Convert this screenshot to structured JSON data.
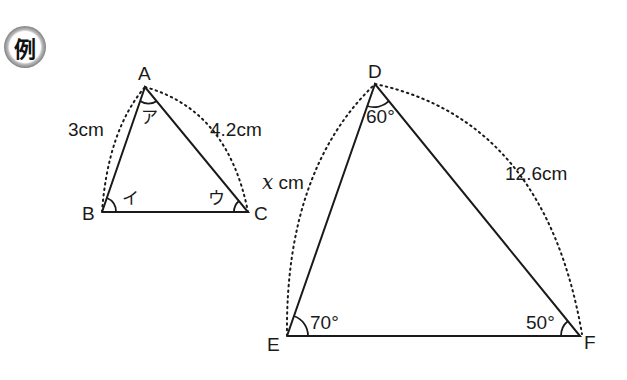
{
  "badge": {
    "label": "例"
  },
  "triangle_small": {
    "vertices": {
      "A": "A",
      "B": "B",
      "C": "C"
    },
    "angles": {
      "A": "ア",
      "B": "イ",
      "C": "ウ"
    },
    "sides": {
      "AB": "3cm",
      "AC": "4.2cm"
    }
  },
  "triangle_large": {
    "vertices": {
      "D": "D",
      "E": "E",
      "F": "F"
    },
    "angles": {
      "D": "60°",
      "E": "70°",
      "F": "50°"
    },
    "sides": {
      "DE_var": "x",
      "DE_unit": "cm",
      "DF": "12.6cm"
    }
  },
  "colors": {
    "stroke": "#1a1a1a",
    "background": "#ffffff"
  }
}
